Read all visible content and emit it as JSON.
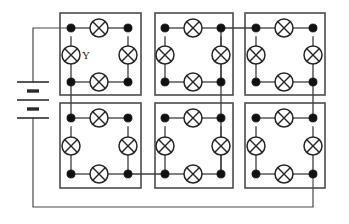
{
  "diagram": {
    "type": "electrical-schematic",
    "background_color": "#ffffff",
    "wire_color": "#3d3d3d",
    "box_color": "#4c4c4c",
    "lamp_color": "#262626",
    "node_color": "#111111"
  },
  "labels": {
    "lamp_y": "Y"
  },
  "source": {
    "name": "battery",
    "symbol": "battery-two-cell",
    "cells": 2,
    "plates": [
      {
        "type": "long",
        "y": 82
      },
      {
        "type": "short",
        "y": 91
      },
      {
        "type": "long",
        "y": 100
      },
      {
        "type": "short",
        "y": 109
      },
      {
        "type": "long",
        "y": 118
      }
    ],
    "x": 33,
    "positive_lead_to_y": 28,
    "negative_lead_to_y": 207
  },
  "boxes": [
    {
      "id": "box-top-left",
      "row": 0,
      "col": 0,
      "x": 60,
      "y": 13,
      "w": 81,
      "h": 82
    },
    {
      "id": "box-top-middle",
      "row": 0,
      "col": 1,
      "x": 155,
      "y": 13,
      "w": 78,
      "h": 82
    },
    {
      "id": "box-top-right",
      "row": 0,
      "col": 2,
      "x": 245,
      "y": 13,
      "w": 80,
      "h": 82
    },
    {
      "id": "box-bottom-left",
      "row": 1,
      "col": 0,
      "x": 60,
      "y": 103,
      "w": 81,
      "h": 85
    },
    {
      "id": "box-bottom-middle",
      "row": 1,
      "col": 1,
      "x": 155,
      "y": 103,
      "w": 78,
      "h": 85
    },
    {
      "id": "box-bottom-right",
      "row": 1,
      "col": 2,
      "x": 245,
      "y": 103,
      "w": 80,
      "h": 85
    }
  ],
  "cells": [
    {
      "id": "cell-top-left",
      "nodes": {
        "tl": [
          71,
          28
        ],
        "tr": [
          128,
          28
        ],
        "bl": [
          71,
          82
        ],
        "br": [
          128,
          82
        ]
      },
      "lamps": [
        {
          "id": "lamp-top",
          "cx": 99,
          "cy": 28,
          "r": 9,
          "orientation": "horizontal"
        },
        {
          "id": "lamp-left",
          "cx": 71,
          "cy": 55,
          "r": 9,
          "orientation": "vertical",
          "label": "Y"
        },
        {
          "id": "lamp-right",
          "cx": 128,
          "cy": 55,
          "r": 9,
          "orientation": "vertical"
        },
        {
          "id": "lamp-bottom",
          "cx": 99,
          "cy": 82,
          "r": 9,
          "orientation": "horizontal"
        }
      ]
    },
    {
      "id": "cell-top-middle",
      "nodes": {
        "tl": [
          165,
          28
        ],
        "tr": [
          221,
          28
        ],
        "bl": [
          165,
          82
        ],
        "br": [
          221,
          82
        ]
      },
      "lamps": [
        {
          "id": "lamp-top",
          "cx": 193,
          "cy": 28,
          "r": 9,
          "orientation": "horizontal"
        },
        {
          "id": "lamp-left",
          "cx": 165,
          "cy": 55,
          "r": 9,
          "orientation": "vertical"
        },
        {
          "id": "lamp-right",
          "cx": 221,
          "cy": 55,
          "r": 9,
          "orientation": "vertical"
        },
        {
          "id": "lamp-bottom",
          "cx": 193,
          "cy": 82,
          "r": 9,
          "orientation": "horizontal"
        }
      ]
    },
    {
      "id": "cell-top-right",
      "nodes": {
        "tl": [
          256,
          28
        ],
        "tr": [
          313,
          28
        ],
        "bl": [
          256,
          82
        ],
        "br": [
          313,
          82
        ]
      },
      "lamps": [
        {
          "id": "lamp-top",
          "cx": 284,
          "cy": 28,
          "r": 9,
          "orientation": "horizontal"
        },
        {
          "id": "lamp-left",
          "cx": 256,
          "cy": 55,
          "r": 9,
          "orientation": "vertical"
        },
        {
          "id": "lamp-right",
          "cx": 313,
          "cy": 55,
          "r": 9,
          "orientation": "vertical"
        },
        {
          "id": "lamp-bottom",
          "cx": 284,
          "cy": 82,
          "r": 9,
          "orientation": "horizontal"
        }
      ]
    },
    {
      "id": "cell-bottom-left",
      "nodes": {
        "tl": [
          71,
          118
        ],
        "tr": [
          128,
          118
        ],
        "bl": [
          71,
          174
        ],
        "br": [
          128,
          174
        ]
      },
      "lamps": [
        {
          "id": "lamp-top",
          "cx": 99,
          "cy": 118,
          "r": 9,
          "orientation": "horizontal"
        },
        {
          "id": "lamp-left",
          "cx": 71,
          "cy": 146,
          "r": 9,
          "orientation": "vertical"
        },
        {
          "id": "lamp-right",
          "cx": 128,
          "cy": 146,
          "r": 9,
          "orientation": "vertical"
        },
        {
          "id": "lamp-bottom",
          "cx": 99,
          "cy": 174,
          "r": 9,
          "orientation": "horizontal"
        }
      ]
    },
    {
      "id": "cell-bottom-middle",
      "nodes": {
        "tl": [
          165,
          118
        ],
        "tr": [
          221,
          118
        ],
        "bl": [
          165,
          174
        ],
        "br": [
          221,
          174
        ]
      },
      "lamps": [
        {
          "id": "lamp-top",
          "cx": 193,
          "cy": 118,
          "r": 9,
          "orientation": "horizontal"
        },
        {
          "id": "lamp-left",
          "cx": 165,
          "cy": 146,
          "r": 9,
          "orientation": "vertical"
        },
        {
          "id": "lamp-right",
          "cx": 221,
          "cy": 146,
          "r": 9,
          "orientation": "vertical"
        },
        {
          "id": "lamp-bottom",
          "cx": 193,
          "cy": 174,
          "r": 9,
          "orientation": "horizontal"
        }
      ]
    },
    {
      "id": "cell-bottom-right",
      "nodes": {
        "tl": [
          256,
          118
        ],
        "tr": [
          313,
          118
        ],
        "bl": [
          256,
          174
        ],
        "br": [
          313,
          174
        ]
      },
      "lamps": [
        {
          "id": "lamp-top",
          "cx": 284,
          "cy": 118,
          "r": 9,
          "orientation": "horizontal"
        },
        {
          "id": "lamp-left",
          "cx": 256,
          "cy": 146,
          "r": 9,
          "orientation": "vertical"
        },
        {
          "id": "lamp-right",
          "cx": 313,
          "cy": 146,
          "r": 9,
          "orientation": "vertical"
        },
        {
          "id": "lamp-bottom",
          "cx": 284,
          "cy": 174,
          "r": 9,
          "orientation": "horizontal"
        }
      ]
    }
  ],
  "interconnects": [
    {
      "id": "wire-battery-pos",
      "d": "M 33 82 L 33 28 L 71 28"
    },
    {
      "id": "wire-col1-vertical",
      "d": "M 71 82 L 71 118"
    },
    {
      "id": "wire-bl-to-bm",
      "d": "M 128 174 L 165 174"
    },
    {
      "id": "wire-bm-to-tm",
      "d": "M 221 174 L 221 28"
    },
    {
      "id": "wire-tm-to-tr",
      "d": "M 221 28 L 256 28"
    },
    {
      "id": "wire-col3-vertical",
      "d": "M 313 82 L 313 118"
    },
    {
      "id": "wire-battery-neg-return",
      "d": "M 313 174 L 313 207 L 33 207 L 33 118"
    }
  ]
}
